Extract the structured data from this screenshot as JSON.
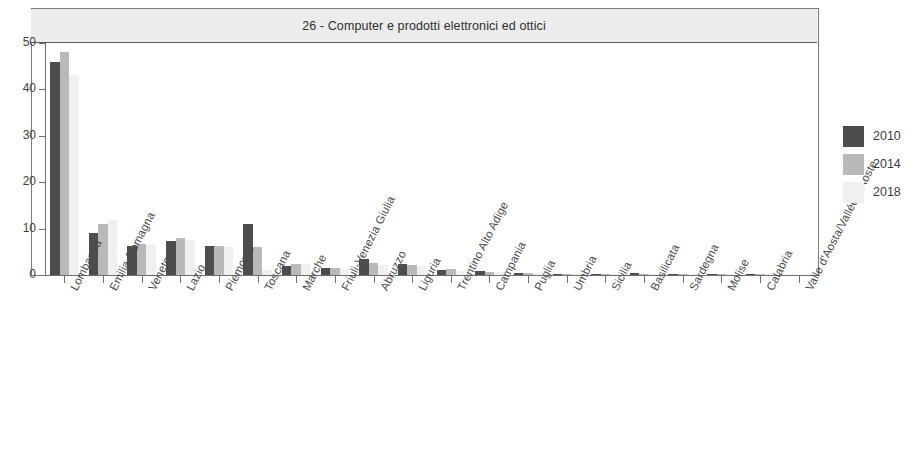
{
  "chart_data": {
    "type": "bar",
    "title": "26 - Computer e prodotti elettronici ed ottici",
    "xlabel": "",
    "ylabel": "",
    "ylim": [
      0,
      50
    ],
    "yticks": [
      0,
      10,
      20,
      30,
      40,
      50
    ],
    "grid": false,
    "legend_position": "right",
    "categories": [
      "Lombardia",
      "Emilia-Romagna",
      "Veneto",
      "Lazio",
      "Piemonte",
      "Toscana",
      "Marche",
      "Friuli-Venezia Giulia",
      "Abruzzo",
      "Liguria",
      "Trentino Alto Adige",
      "Campania",
      "Puglia",
      "Umbria",
      "Sicilia",
      "Basilicata",
      "Sardegna",
      "Molise",
      "Calabria",
      "Valle d'Aosta/Vallée d'Aoste"
    ],
    "series": [
      {
        "name": "2010",
        "color": "#4d4d4d",
        "values": [
          46.0,
          9.1,
          6.3,
          7.4,
          6.3,
          11.0,
          1.9,
          1.5,
          3.4,
          2.3,
          1.1,
          0.9,
          0.5,
          0.2,
          0.2,
          0.4,
          0.1,
          0.05,
          0.05,
          0.0
        ]
      },
      {
        "name": "2014",
        "color": "#b9b9b9",
        "values": [
          48.0,
          10.9,
          6.6,
          8.0,
          6.3,
          6.1,
          2.4,
          1.5,
          2.6,
          2.1,
          1.2,
          0.7,
          0.4,
          0.25,
          0.2,
          0.2,
          0.1,
          0.05,
          0.05,
          0.0
        ]
      },
      {
        "name": "2018",
        "color": "#f0f0f0",
        "values": [
          43.0,
          11.8,
          6.5,
          7.6,
          6.0,
          1.0,
          2.3,
          1.4,
          2.2,
          1.9,
          0.9,
          0.6,
          0.4,
          0.2,
          0.15,
          0.15,
          0.1,
          0.05,
          0.05,
          0.0
        ]
      }
    ]
  },
  "legend": {
    "items": [
      {
        "label": "2010",
        "color": "#4d4d4d"
      },
      {
        "label": "2014",
        "color": "#b9b9b9"
      },
      {
        "label": "2018",
        "color": "#f0f0f0"
      }
    ]
  },
  "colors": {
    "axis": "#6e6e6e",
    "frame": "#7c7c7c",
    "title_band": "#ececed",
    "text": "#3a3a3a"
  }
}
